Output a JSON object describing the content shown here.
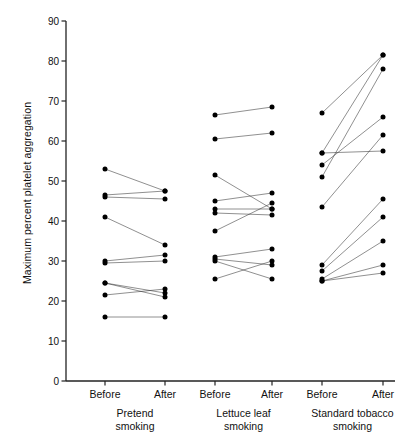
{
  "chart_data": {
    "type": "line",
    "title": "",
    "xlabel": "",
    "ylabel": "Maximum percent platelet aggregation",
    "ylim": [
      0,
      90
    ],
    "ytick_step": 10,
    "yticks": [
      0,
      10,
      20,
      30,
      40,
      50,
      60,
      70,
      80,
      90
    ],
    "ytick_labels": [
      "0",
      "10",
      "20",
      "30",
      "40",
      "50",
      "60",
      "70",
      "80",
      "90"
    ],
    "grid": false,
    "legend": "none",
    "x_conditions": [
      "Before",
      "After"
    ],
    "groups": [
      {
        "name": "Pretend smoking",
        "label_lines": [
          "Pretend",
          "smoking"
        ],
        "pairs": [
          {
            "before": 53.0,
            "after": 47.5
          },
          {
            "before": 46.5,
            "after": 47.5
          },
          {
            "before": 46.0,
            "after": 45.5
          },
          {
            "before": 41.0,
            "after": 34.0
          },
          {
            "before": 30.0,
            "after": 31.5
          },
          {
            "before": 29.5,
            "after": 30.0
          },
          {
            "before": 24.5,
            "after": 22.0
          },
          {
            "before": 24.5,
            "after": 21.0
          },
          {
            "before": 21.5,
            "after": 23.0
          },
          {
            "before": 16.0,
            "after": 16.0
          }
        ]
      },
      {
        "name": "Lettuce leaf smoking",
        "label_lines": [
          "Lettuce leaf",
          "smoking"
        ],
        "pairs": [
          {
            "before": 66.5,
            "after": 68.5
          },
          {
            "before": 60.5,
            "after": 62.0
          },
          {
            "before": 51.5,
            "after": 43.0
          },
          {
            "before": 45.0,
            "after": 47.0
          },
          {
            "before": 43.0,
            "after": 43.0
          },
          {
            "before": 42.0,
            "after": 41.5
          },
          {
            "before": 37.5,
            "after": 44.5
          },
          {
            "before": 31.0,
            "after": 33.0
          },
          {
            "before": 30.5,
            "after": 29.0
          },
          {
            "before": 30.0,
            "after": 25.5
          },
          {
            "before": 25.5,
            "after": 30.0
          }
        ]
      },
      {
        "name": "Standard tobacco smoking",
        "label_lines": [
          "Standard tobacco",
          "smoking"
        ],
        "pairs": [
          {
            "before": 67.0,
            "after": 81.5
          },
          {
            "before": 57.0,
            "after": 81.5
          },
          {
            "before": 57.0,
            "after": 57.5
          },
          {
            "before": 54.0,
            "after": 66.0
          },
          {
            "before": 51.0,
            "after": 78.0
          },
          {
            "before": 43.5,
            "after": 61.5
          },
          {
            "before": 29.0,
            "after": 45.5
          },
          {
            "before": 27.5,
            "after": 41.0
          },
          {
            "before": 25.5,
            "after": 35.0
          },
          {
            "before": 25.0,
            "after": 29.0
          },
          {
            "before": 25.0,
            "after": 27.0
          }
        ]
      }
    ]
  },
  "axis": {
    "y_title": "Maximum percent platelet aggregation"
  }
}
